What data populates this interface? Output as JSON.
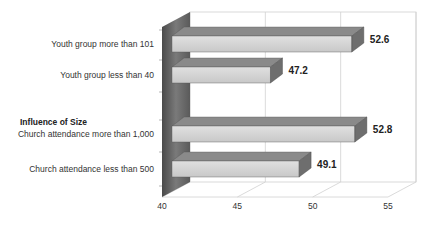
{
  "chart_data": {
    "type": "bar",
    "orientation": "horizontal",
    "style": "3d",
    "title": "",
    "xlabel": "",
    "ylabel": "",
    "group_label": "Influence of Size",
    "categories": [
      "Youth group more than 101",
      "Youth group less than 40",
      "Church attendance more than 1,000",
      "Church attendance less than 500"
    ],
    "values": [
      52.6,
      47.2,
      52.8,
      49.1
    ],
    "value_labels": [
      "52.6",
      "47.2",
      "52.8",
      "49.1"
    ],
    "xlim": [
      40,
      55
    ],
    "xticks": [
      40,
      45,
      50,
      55
    ],
    "xtick_labels": [
      "40",
      "45",
      "50",
      "55"
    ],
    "grid": true,
    "legend": "none",
    "colors": {
      "bar_front": "#d4d4d4",
      "bar_top": "#8a8a8a",
      "bar_side": "#6e6e6e",
      "left_wall": "#5a5a5a",
      "grid": "#d0d0d0"
    }
  }
}
